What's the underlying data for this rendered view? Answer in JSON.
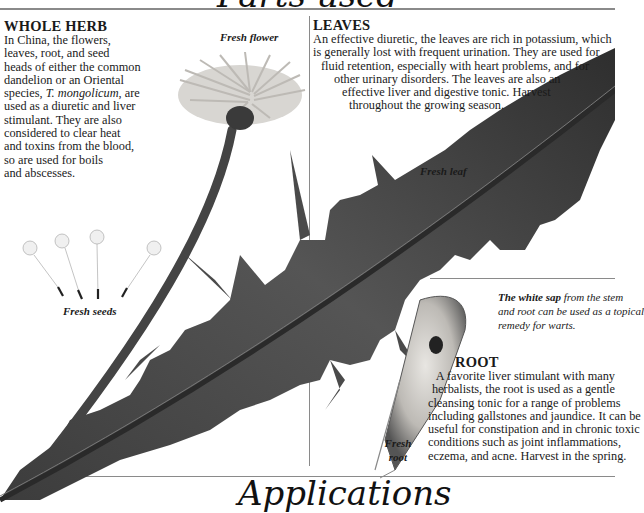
{
  "page": {
    "top_title": "Parts used",
    "bottom_title": "Applications"
  },
  "sections": {
    "whole_herb": {
      "heading": "WHOLE HERB",
      "lines": [
        "In China, the flowers,",
        "leaves, root, and seed",
        "heads of either the common",
        "dandelion or an Oriental",
        "species, T. mongolicum, are",
        "used as a diuretic and liver",
        "stimulant. They are also",
        "considered to clear heat",
        "and toxins from the blood,",
        "so are used for boils",
        "and abscesses."
      ],
      "species_prefix": "species, ",
      "species_italic": "T. mongolicum",
      "species_suffix": ", are"
    },
    "leaves": {
      "heading": "LEAVES",
      "lines": [
        "An effective diuretic, the leaves are rich in potassium, which",
        "is generally lost with frequent urination. They are used for",
        "fluid retention, especially with heart problems, and for",
        "other urinary disorders. The leaves are also an",
        "effective liver and digestive tonic. Harvest",
        "throughout the growing season."
      ]
    },
    "root": {
      "heading": "ROOT",
      "lines": [
        "A favorite liver stimulant with many",
        "herbalists, the root is used as a gentle",
        "cleansing tonic for a range of problems",
        "including gallstones and jaundice. It can be",
        "useful for constipation and in chronic toxic",
        "conditions such as joint inflammations,",
        "eczema, and acne. Harvest in the spring."
      ]
    },
    "sap_note": {
      "bold": "The white sap",
      "rest_line1": " from the stem",
      "line2": "and root can be used as a topical",
      "line3": "remedy for warts."
    }
  },
  "captions": {
    "flower": "Fresh flower",
    "leaf": "Fresh leaf",
    "seeds": "Fresh seeds",
    "root_line1": "Fresh",
    "root_line2": "root"
  },
  "colors": {
    "rule": "#8a8a8a",
    "leaf_dark": "#3a3a3a",
    "leaf_mid": "#5e5e5e",
    "text": "#1a1a1a"
  }
}
